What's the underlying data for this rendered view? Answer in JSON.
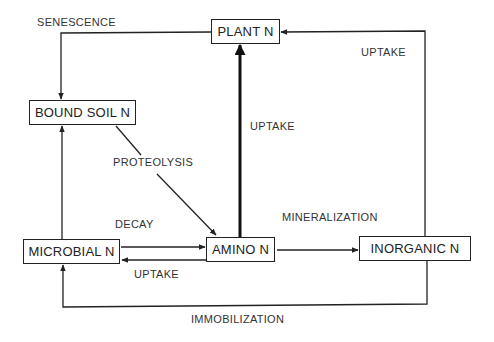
{
  "diagram": {
    "title": "",
    "nodes": {
      "plant": {
        "label": "PLANT N"
      },
      "bound_soil": {
        "label": "BOUND SOIL N"
      },
      "microbial": {
        "label": "MICROBIAL N"
      },
      "amino": {
        "label": "AMINO N"
      },
      "inorganic": {
        "label": "INORGANIC N"
      }
    },
    "edges": {
      "senescence": {
        "label": "SENESCENCE",
        "from": "PLANT N",
        "to": "BOUND SOIL N"
      },
      "uptake_inorganic_plant": {
        "label": "UPTAKE",
        "from": "INORGANIC N",
        "to": "PLANT N"
      },
      "uptake_amino_plant": {
        "label": "UPTAKE",
        "from": "AMINO N",
        "to": "PLANT N",
        "emphasis": "thick"
      },
      "proteolysis": {
        "label": "PROTEOLYSIS",
        "from": "BOUND SOIL N",
        "to": "AMINO N"
      },
      "microbial_to_bound": {
        "label": "",
        "from": "MICROBIAL N",
        "to": "BOUND SOIL N"
      },
      "decay": {
        "label": "DECAY",
        "from": "MICROBIAL N",
        "to": "AMINO N"
      },
      "uptake_amino_microbial": {
        "label": "UPTAKE",
        "from": "AMINO N",
        "to": "MICROBIAL N"
      },
      "mineralization": {
        "label": "MINERALIZATION",
        "from": "AMINO N",
        "to": "INORGANIC N"
      },
      "immobilization": {
        "label": "IMMOBILIZATION",
        "from": "INORGANIC N",
        "to": "MICROBIAL N"
      }
    },
    "colors": {
      "line": "#222222",
      "background": "#ffffff"
    }
  }
}
